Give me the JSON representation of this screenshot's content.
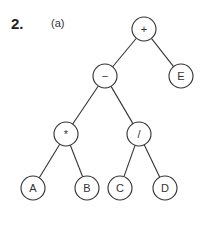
{
  "problem": {
    "number": "2.",
    "part": "(a)"
  },
  "tree": {
    "node_radius": 12,
    "nodes": [
      {
        "id": "plus",
        "label": "+",
        "x": 144,
        "y": 29
      },
      {
        "id": "minus",
        "label": "−",
        "x": 105,
        "y": 76
      },
      {
        "id": "E",
        "label": "E",
        "x": 181,
        "y": 76
      },
      {
        "id": "times",
        "label": "*",
        "x": 66,
        "y": 134
      },
      {
        "id": "div",
        "label": "/",
        "x": 139,
        "y": 134
      },
      {
        "id": "A",
        "label": "A",
        "x": 33,
        "y": 188
      },
      {
        "id": "B",
        "label": "B",
        "x": 87,
        "y": 188
      },
      {
        "id": "C",
        "label": "C",
        "x": 120,
        "y": 188
      },
      {
        "id": "D",
        "label": "D",
        "x": 165,
        "y": 188
      }
    ],
    "edges": [
      [
        "plus",
        "minus"
      ],
      [
        "plus",
        "E"
      ],
      [
        "minus",
        "times"
      ],
      [
        "minus",
        "div"
      ],
      [
        "times",
        "A"
      ],
      [
        "times",
        "B"
      ],
      [
        "div",
        "C"
      ],
      [
        "div",
        "D"
      ]
    ]
  }
}
